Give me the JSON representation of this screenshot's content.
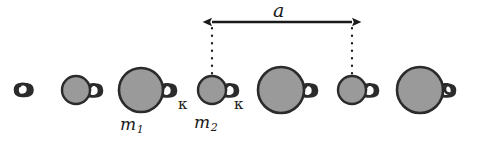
{
  "figure": {
    "name": "diatomic-spring-mass-chain",
    "caption_labels": {
      "lattice_constant": "a",
      "mass_heavy": "m",
      "mass_heavy_sub": "1",
      "mass_light": "m",
      "mass_light_sub": "2",
      "spring_constant_left": "κ",
      "spring_constant_right": "κ"
    },
    "colors": {
      "ball_fill": "#9a9a9a",
      "ball_stroke": "#2b2b2b",
      "spring_stroke": "#2b2b2b",
      "ink": "#1a1a1a",
      "background": "#ffffff"
    },
    "geometry": {
      "baseline_y": 90,
      "chain_start_x": 20,
      "chain_end_x": 478,
      "dimension_arrow_y": 22,
      "dimension_left_x": 211,
      "dimension_right_x": 353,
      "dotted_top_y": 28,
      "dotted_bottom_y": 76
    },
    "masses": [
      {
        "id": "mass-small-1",
        "type": "light",
        "cx": 76,
        "cy": 90,
        "r": 14
      },
      {
        "id": "mass-large-1",
        "type": "heavy",
        "cx": 141,
        "cy": 90,
        "r": 22
      },
      {
        "id": "mass-small-2",
        "type": "light",
        "cx": 212,
        "cy": 90,
        "r": 14
      },
      {
        "id": "mass-large-2",
        "type": "heavy",
        "cx": 281,
        "cy": 90,
        "r": 23
      },
      {
        "id": "mass-small-3",
        "type": "light",
        "cx": 352,
        "cy": 90,
        "r": 14
      },
      {
        "id": "mass-large-3",
        "type": "heavy",
        "cx": 420,
        "cy": 90,
        "r": 23
      }
    ]
  }
}
